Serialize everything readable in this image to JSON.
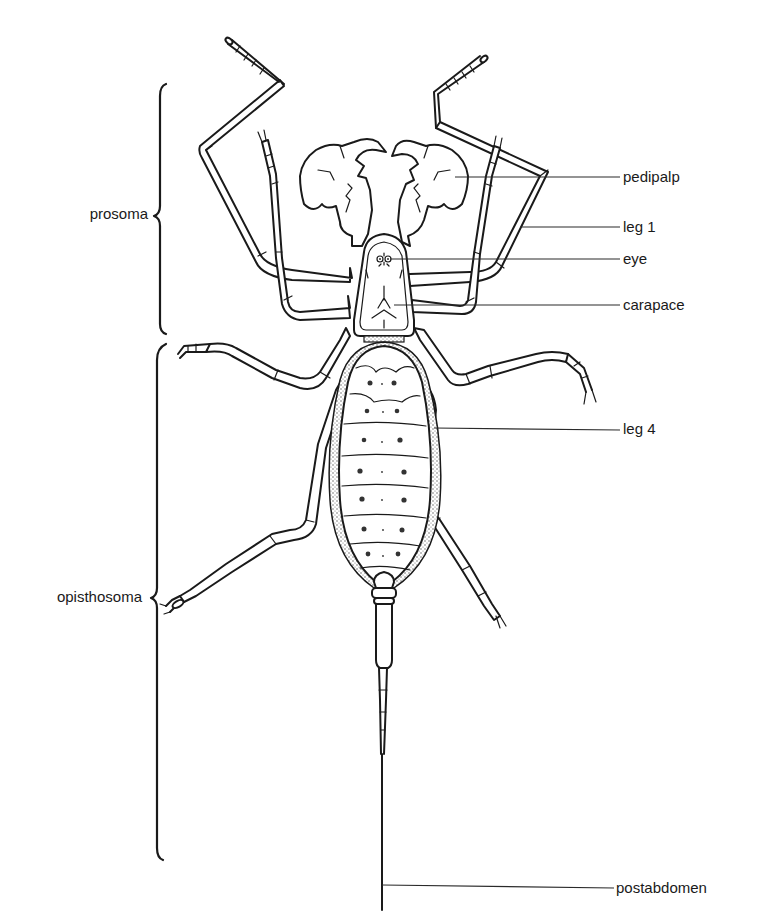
{
  "diagram": {
    "ink_color": "#1a1a1a",
    "background": "#ffffff"
  },
  "regions": {
    "prosoma": "prosoma",
    "opisthosoma": "opisthosoma"
  },
  "labels": {
    "pedipalp": "pedipalp",
    "leg1": "leg 1",
    "eye": "eye",
    "carapace": "carapace",
    "leg4": "leg 4",
    "postabdomen": "postabdomen"
  }
}
